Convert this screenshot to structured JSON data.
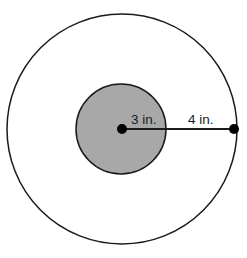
{
  "figure": {
    "canvas": {
      "width": 247,
      "height": 258,
      "background": "#ffffff"
    },
    "center": {
      "x": 122,
      "y": 129
    },
    "colors": {
      "stroke": "#1a1a1a",
      "inner_fill": "#a8a8a8",
      "outer_fill": "#ffffff",
      "dot": "#000000",
      "text": "#1a1a1a"
    },
    "outer_circle": {
      "name": "outer-circle",
      "cx": 122,
      "cy": 129,
      "r": 115,
      "fill": "#ffffff",
      "stroke": "#1a1a1a",
      "stroke_width": 1.5
    },
    "inner_circle": {
      "name": "inner-circle",
      "cx": 121,
      "cy": 129,
      "r": 45,
      "fill": "#a8a8a8",
      "stroke": "#1a1a1a",
      "stroke_width": 1.5
    },
    "center_point": {
      "cx": 122,
      "cy": 129,
      "r": 5
    },
    "edge_point": {
      "cx": 234,
      "cy": 129,
      "r": 5
    },
    "radius_line": {
      "x1": 122,
      "y1": 129,
      "x2": 234,
      "y2": 129,
      "stroke_width": 2
    },
    "labels": [
      {
        "id": "inner-radius-label",
        "text": "3 in.",
        "x": 131,
        "y": 124,
        "describes": "radius of the shaded inner circle"
      },
      {
        "id": "annulus-width-label",
        "text": "4 in.",
        "x": 188,
        "y": 124,
        "describes": "distance from inner circle edge to outer circle edge"
      }
    ]
  }
}
